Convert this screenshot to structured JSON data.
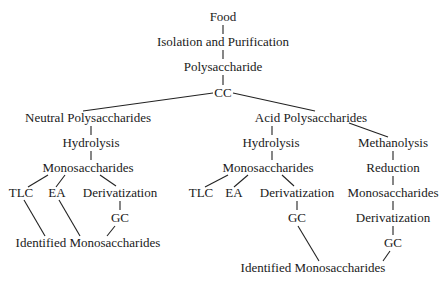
{
  "diagram": {
    "title": "",
    "nodes": {
      "food": {
        "label": "Food",
        "x": 223,
        "y": 17
      },
      "isolation": {
        "label": "Isolation and Purification",
        "x": 223,
        "y": 42
      },
      "polysaccharide": {
        "label": "Polysaccharide",
        "x": 223,
        "y": 67
      },
      "cc": {
        "label": "CC",
        "x": 223,
        "y": 93
      },
      "neutral": {
        "label": "Neutral Polysaccharides",
        "x": 88,
        "y": 118
      },
      "acid": {
        "label": "Acid Polysaccharides",
        "x": 311,
        "y": 118
      },
      "hydrolysis_l": {
        "label": "Hydrolysis",
        "x": 91,
        "y": 143
      },
      "hydrolysis_r": {
        "label": "Hydrolysis",
        "x": 271,
        "y": 143
      },
      "methanolysis": {
        "label": "Methanolysis",
        "x": 393,
        "y": 143
      },
      "mono_l": {
        "label": "Monosaccharides",
        "x": 88,
        "y": 168
      },
      "mono_r": {
        "label": "Monosaccharides",
        "x": 268,
        "y": 168
      },
      "reduction": {
        "label": "Reduction",
        "x": 393,
        "y": 168
      },
      "tlc_l": {
        "label": "TLC",
        "x": 21,
        "y": 193
      },
      "ea_l": {
        "label": "EA",
        "x": 57,
        "y": 193
      },
      "deriv_l": {
        "label": "Derivatization",
        "x": 120,
        "y": 193
      },
      "tlc_r": {
        "label": "TLC",
        "x": 201,
        "y": 193
      },
      "ea_r": {
        "label": "EA",
        "x": 234,
        "y": 193
      },
      "deriv_r": {
        "label": "Derivatization",
        "x": 297,
        "y": 193
      },
      "mono_m": {
        "label": "Monosaccharides",
        "x": 393,
        "y": 193
      },
      "gc_l": {
        "label": "GC",
        "x": 120,
        "y": 218
      },
      "gc_r": {
        "label": "GC",
        "x": 297,
        "y": 218
      },
      "deriv_m": {
        "label": "Derivatization",
        "x": 393,
        "y": 218
      },
      "ident_l": {
        "label": "Identified Monosaccharides",
        "x": 88,
        "y": 243
      },
      "gc_m": {
        "label": "GC",
        "x": 393,
        "y": 243
      },
      "ident_r": {
        "label": "Identified Monosaccharides",
        "x": 313,
        "y": 268
      }
    },
    "edges": [
      [
        223,
        25,
        223,
        34
      ],
      [
        223,
        50,
        223,
        59
      ],
      [
        223,
        75,
        223,
        85
      ],
      [
        213,
        93,
        83,
        111
      ],
      [
        233,
        93,
        315,
        111
      ],
      [
        91,
        126,
        91,
        135
      ],
      [
        272,
        126,
        272,
        135
      ],
      [
        349,
        123,
        388,
        137
      ],
      [
        91,
        151,
        91,
        160
      ],
      [
        272,
        151,
        272,
        160
      ],
      [
        393,
        151,
        393,
        160
      ],
      [
        48,
        175,
        28,
        187
      ],
      [
        65,
        175,
        56,
        187
      ],
      [
        100,
        175,
        116,
        186
      ],
      [
        228,
        175,
        205,
        187
      ],
      [
        248,
        175,
        234,
        187
      ],
      [
        282,
        175,
        294,
        186
      ],
      [
        393,
        176,
        393,
        185
      ],
      [
        120,
        201,
        120,
        210
      ],
      [
        297,
        201,
        297,
        210
      ],
      [
        393,
        201,
        393,
        210
      ],
      [
        24,
        200,
        45,
        236
      ],
      [
        59,
        200,
        80,
        236
      ],
      [
        115,
        226,
        107,
        236
      ],
      [
        298,
        226,
        319,
        261
      ],
      [
        393,
        226,
        393,
        235
      ],
      [
        390,
        251,
        383,
        261
      ]
    ]
  }
}
